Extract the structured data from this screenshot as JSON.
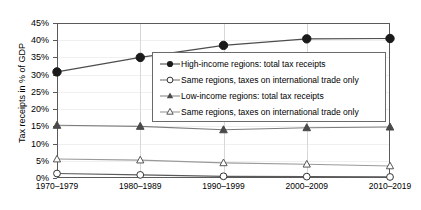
{
  "chart_data": {
    "type": "line",
    "title": "",
    "xlabel": "",
    "ylabel": "Tax receipts in % of GDP",
    "categories": [
      "1970–1979",
      "1980–1989",
      "1990–1999",
      "2000–2009",
      "2010–2019"
    ],
    "ylim": [
      0,
      45
    ],
    "ytick_labels": [
      "0%",
      "5%",
      "10%",
      "15%",
      "20%",
      "25%",
      "30%",
      "35%",
      "40%",
      "45%"
    ],
    "ytick_values": [
      0,
      5,
      10,
      15,
      20,
      25,
      30,
      35,
      40,
      45
    ],
    "grid": "vertical gridlines at each category; faint horizontal gridlines",
    "legend_position": "inside plot, center-right",
    "series": [
      {
        "name": "High-income regions: total tax receipts",
        "marker": "filled-circle",
        "values": [
          30.8,
          35.0,
          38.5,
          40.4,
          40.5
        ]
      },
      {
        "name": "Same regions, taxes on international trade only",
        "marker": "open-circle",
        "values": [
          1.3,
          0.9,
          0.5,
          0.4,
          0.3
        ]
      },
      {
        "name": "Low-income regions: total tax receipts",
        "marker": "filled-triangle",
        "values": [
          15.3,
          15.0,
          14.0,
          14.6,
          14.8
        ]
      },
      {
        "name": "Same regions, taxes on international trade only",
        "marker": "open-triangle",
        "values": [
          5.5,
          5.2,
          4.4,
          4.0,
          3.5
        ]
      }
    ]
  },
  "legend": {
    "items": [
      {
        "label": "High-income regions: total tax receipts",
        "marker": "filled-circle"
      },
      {
        "label": "Same regions, taxes on international trade only",
        "marker": "open-circle"
      },
      {
        "label": "Low-income regions: total tax receipts",
        "marker": "filled-triangle"
      },
      {
        "label": "Same regions, taxes on international trade only",
        "marker": "open-triangle"
      }
    ]
  },
  "colors": {
    "line": "#4d4d4d",
    "axis": "#5a5a5a",
    "gridline": "#d8d8d8",
    "text": "#000000",
    "background": "#ffffff"
  }
}
